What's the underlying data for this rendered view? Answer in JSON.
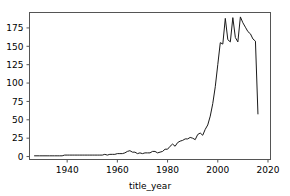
{
  "chart_data": {
    "type": "line",
    "title": "",
    "xlabel": "title_year",
    "ylabel": "",
    "xlim": [
      1925,
      2021
    ],
    "ylim": [
      -4,
      196
    ],
    "xticks": [
      1940,
      1960,
      1980,
      2000,
      2020
    ],
    "xtick_labels": [
      "1940",
      "1960",
      "1980",
      "2000",
      "2020"
    ],
    "yticks": [
      0,
      25,
      50,
      75,
      100,
      125,
      150,
      175
    ],
    "ytick_labels": [
      "0",
      "25",
      "50",
      "75",
      "100",
      "125",
      "150",
      "175"
    ],
    "grid": false,
    "legend": null,
    "line_color": "#1a1a1a",
    "series": [
      {
        "name": "count",
        "x": [
          1927,
          1929,
          1930,
          1932,
          1933,
          1934,
          1935,
          1936,
          1937,
          1938,
          1939,
          1940,
          1941,
          1942,
          1943,
          1944,
          1945,
          1946,
          1947,
          1948,
          1949,
          1950,
          1951,
          1952,
          1953,
          1954,
          1955,
          1956,
          1957,
          1958,
          1959,
          1960,
          1961,
          1962,
          1963,
          1964,
          1965,
          1966,
          1967,
          1968,
          1969,
          1970,
          1971,
          1972,
          1973,
          1974,
          1975,
          1976,
          1977,
          1978,
          1979,
          1980,
          1981,
          1982,
          1983,
          1984,
          1985,
          1986,
          1987,
          1988,
          1989,
          1990,
          1991,
          1992,
          1993,
          1994,
          1995,
          1996,
          1997,
          1998,
          1999,
          2000,
          2001,
          2002,
          2003,
          2004,
          2005,
          2006,
          2007,
          2008,
          2009,
          2010,
          2011,
          2012,
          2013,
          2014,
          2015,
          2016
        ],
        "values": [
          1,
          1,
          1,
          1,
          1,
          1,
          1,
          1,
          1,
          1,
          2,
          2,
          2,
          2,
          2,
          2,
          2,
          2,
          2,
          2,
          2,
          2,
          2,
          2,
          2,
          2,
          3,
          2,
          3,
          3,
          3,
          4,
          4,
          4,
          5,
          7,
          8,
          6,
          6,
          4,
          5,
          4,
          5,
          5,
          5,
          7,
          7,
          5,
          6,
          7,
          10,
          10,
          14,
          17,
          14,
          19,
          21,
          22,
          24,
          24,
          26,
          25,
          23,
          30,
          32,
          29,
          37,
          43,
          55,
          72,
          95,
          125,
          155,
          153,
          188,
          159,
          156,
          189,
          162,
          156,
          190,
          182,
          176,
          170,
          167,
          160,
          157,
          58
        ],
        "marker": "none",
        "linewidth": 1
      }
    ],
    "peak": {
      "x": 2009,
      "y": 190
    },
    "final_point": {
      "x": 2016,
      "y": 58
    }
  },
  "figure": {
    "background": "#ffffff",
    "spine_color": "#555555",
    "text_color": "#000000"
  }
}
